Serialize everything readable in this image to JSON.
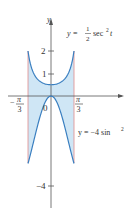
{
  "chart_data": {
    "type": "area",
    "title": "",
    "xlabel": "",
    "ylabel": "y",
    "xlim": [
      -1.0472,
      1.0472
    ],
    "ylim": [
      -4.5,
      4
    ],
    "grid": false,
    "legend_position": "none",
    "x_tick_labels": [
      "-π/3",
      "0",
      "π/3"
    ],
    "y_tick_labels": [
      "2",
      "1",
      "-4"
    ],
    "y_ticks": [
      2,
      1,
      -4
    ],
    "series": [
      {
        "name": "y = ½ sec² t",
        "function": "0.5*sec(t)^2",
        "x": [
          -1.0472,
          -0.7854,
          -0.5236,
          -0.2618,
          0,
          0.2618,
          0.5236,
          0.7854,
          1.0472
        ],
        "values": [
          2.0,
          1.0,
          0.667,
          0.536,
          0.5,
          0.536,
          0.667,
          1.0,
          2.0
        ]
      },
      {
        "name": "y = -4 sin² t",
        "function": "-4*sin(t)^2",
        "x": [
          -1.0472,
          -0.7854,
          -0.5236,
          -0.2618,
          0,
          0.2618,
          0.5236,
          0.7854,
          1.0472
        ],
        "values": [
          -3.0,
          -2.0,
          -1.0,
          -0.268,
          0,
          -0.268,
          -1.0,
          -2.0,
          -3.0
        ]
      }
    ],
    "shaded_region": "between curves for -π/3 ≤ t ≤ π/3",
    "annotations": [
      "y = ½ sec² t",
      "y = −4 sin² t"
    ]
  },
  "labels": {
    "y_axis": "y",
    "tick_2": "2",
    "tick_1": "1",
    "tick_neg4": "−4",
    "origin": "0",
    "neg_pi": "π",
    "neg_pi_minus": "−",
    "neg_three": "3",
    "pos_pi": "π",
    "pos_three": "3",
    "curve1_prefix": "y =",
    "curve1_num": "1",
    "curve1_den": "2",
    "curve1_func": "sec",
    "curve1_exp": "2",
    "curve1_var": "t",
    "curve2_text": "y = −4 sin",
    "curve2_exp": "2"
  },
  "colors": {
    "fill": "#cfe6f5",
    "curve": "#3a7fc0",
    "bound": "#e08a8a",
    "axis": "#555555"
  }
}
